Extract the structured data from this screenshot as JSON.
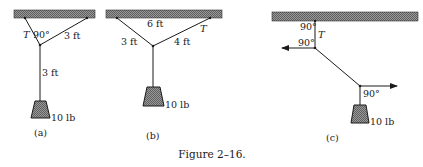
{
  "caption": "Figure 2–16.",
  "panels": {
    "a": {
      "label": "(a)",
      "tension_label": "T",
      "angle_label": "90°",
      "right_rope_length": "3 ft",
      "vertical_rope_length": "3 ft",
      "weight": "10 lb"
    },
    "b": {
      "label": "(b)",
      "ceiling_span": "6 ft",
      "left_rope_length": "3 ft",
      "right_rope_length": "4 ft",
      "tension_label": "T",
      "weight": "10 lb"
    },
    "c": {
      "label": "(c)",
      "top_angle": "90°",
      "tension_label": "T",
      "left_angle": "90°",
      "lower_angle": "90°",
      "weight": "10 lb"
    }
  },
  "colors": {
    "ink": "#1a1a1a",
    "hatch": "#7a7a7a"
  }
}
